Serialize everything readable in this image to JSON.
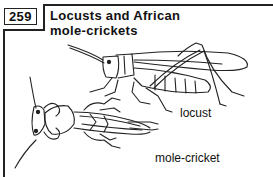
{
  "figure": {
    "number": "259",
    "title": "Locusts and African mole-crickets",
    "title_lines": [
      "Locusts and African",
      "mole-crickets"
    ]
  },
  "illustrations": [
    {
      "name": "locust",
      "label": "locust"
    },
    {
      "name": "mole-cricket",
      "label": "mole-cricket"
    }
  ],
  "colors": {
    "ink": "#222222",
    "background": "#ffffff"
  }
}
